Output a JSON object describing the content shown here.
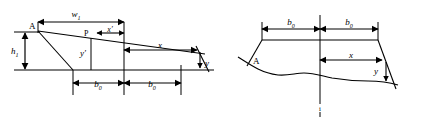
{
  "figure": {
    "panels": [
      {
        "id": "left-panel",
        "name": "left-diagram",
        "description": "Trapezoidal embankment cross section with straight ground line, crest width w1, height h1, base offsets b0, interior point P with offsets x' and y', and edge point with offsets x and y.",
        "labels": {
          "crest_width": "w",
          "crest_width_sub": "1",
          "height": "h",
          "height_sub": "1",
          "point_a": "A",
          "point_p": "P",
          "offset_x_prime": "x′",
          "offset_y_prime": "y′",
          "offset_x": "x",
          "offset_y": "y",
          "base_left": "b",
          "base_left_sub": "0",
          "base_right": "b",
          "base_right_sub": "0"
        }
      },
      {
        "id": "right-panel",
        "name": "right-diagram",
        "description": "Trapezoidal embankment cross section over an irregular natural ground surface, symmetric base offsets b0 about a vertical centerline, point A on left toe, and edge offsets x and y.",
        "labels": {
          "point_a": "A",
          "base_left": "b",
          "base_left_sub": "0",
          "base_right": "b",
          "base_right_sub": "0",
          "offset_x": "x",
          "offset_y": "y",
          "centerline_mark": "i"
        }
      }
    ],
    "colors": {
      "stroke": "#000000",
      "background": "#ffffff",
      "text": "#000000"
    }
  }
}
